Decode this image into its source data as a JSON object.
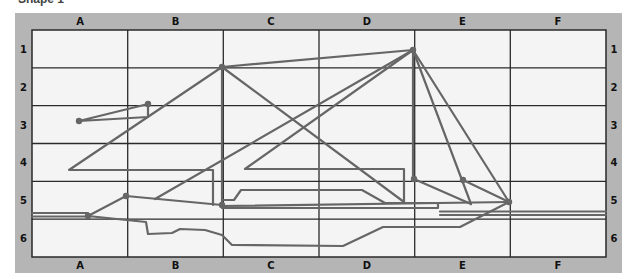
{
  "title": "Shape 1",
  "colors": {
    "frame": "#b5b5b5",
    "cell_bg": "#f4f4f4",
    "grid_line": "#2a2a2a",
    "shape_line": "#666666",
    "label": "#111111"
  },
  "grid": {
    "columns": [
      "A",
      "B",
      "C",
      "D",
      "E",
      "F"
    ],
    "rows": [
      "1",
      "2",
      "3",
      "4",
      "5",
      "6"
    ]
  },
  "shape": {
    "name": "sailboat",
    "points": [
      {
        "x": 79,
        "y": 121
      },
      {
        "x": 148,
        "y": 104
      },
      {
        "x": 222,
        "y": 67
      },
      {
        "x": 413,
        "y": 50
      },
      {
        "x": 126,
        "y": 196
      },
      {
        "x": 88,
        "y": 216
      },
      {
        "x": 222,
        "y": 205
      },
      {
        "x": 414,
        "y": 179
      },
      {
        "x": 463,
        "y": 180
      },
      {
        "x": 509,
        "y": 202
      }
    ]
  }
}
